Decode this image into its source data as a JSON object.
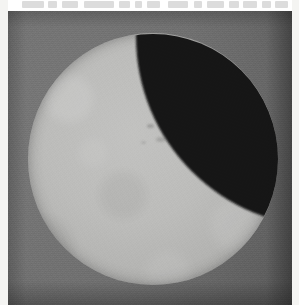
{
  "image": {
    "kind": "scanned-photograph",
    "subject": "partial-solar-eclipse",
    "caption": "Scanned photographic plate showing a bright solar disc partially occulted at the upper right by a dark lune.",
    "width_px": 299,
    "height_px": 305
  },
  "margins": {
    "left_label": "paper margin left",
    "right_label": "paper margin right",
    "paper_color": "#f4f4f2"
  },
  "scan_residue": {
    "label": "illegible cropped text remnants along top edge",
    "legible": "false",
    "text": "",
    "smudges": [
      {
        "left": 14,
        "width": 22
      },
      {
        "left": 40,
        "width": 9
      },
      {
        "left": 54,
        "width": 16
      },
      {
        "left": 76,
        "width": 30
      },
      {
        "left": 111,
        "width": 11
      },
      {
        "left": 127,
        "width": 7
      },
      {
        "left": 139,
        "width": 13
      },
      {
        "left": 160,
        "width": 20
      },
      {
        "left": 186,
        "width": 8
      },
      {
        "left": 199,
        "width": 17
      },
      {
        "left": 221,
        "width": 10
      },
      {
        "left": 235,
        "width": 14
      },
      {
        "left": 254,
        "width": 9
      },
      {
        "left": 267,
        "width": 13
      }
    ]
  },
  "plate": {
    "label": "photographic plate",
    "background_color": "#6d6d6d",
    "vignette": "true"
  },
  "disc": {
    "label": "solar disc",
    "color": "#bcbcba",
    "center_x": 145,
    "center_y": 148,
    "radius_px": 125,
    "diameter_px": 250
  },
  "occultation": {
    "label": "dark lune",
    "color": "#141414",
    "position": "upper-right",
    "tip_top": [
      196,
      19
    ],
    "tip_bottom": [
      258,
      131
    ],
    "coverage_note": "small lens-shaped bite along the upper-right limb"
  },
  "surface_marks": {
    "label": "faint sunspot markings",
    "count": 3,
    "color": "#555555"
  }
}
